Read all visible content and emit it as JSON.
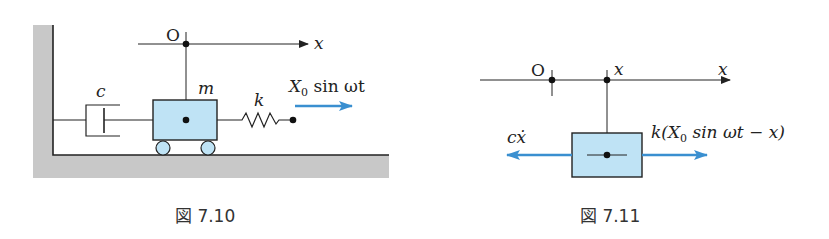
{
  "figures": [
    {
      "id": "fig-7-10",
      "caption": "図 7.10",
      "labels": {
        "origin": "O",
        "axis": "x",
        "damper": "c",
        "mass": "m",
        "spring": "k",
        "forcing": "X",
        "forcing_sub": "0",
        "forcing_rest": " sin ωt"
      }
    },
    {
      "id": "fig-7-11",
      "caption": "図 7.11",
      "labels": {
        "origin": "O",
        "position": "x",
        "axis": "x",
        "damping_force": "cẋ",
        "spring_force_pre": "k(X",
        "spring_force_sub": "0",
        "spring_force_post": " sin ωt − x)"
      }
    }
  ],
  "colors": {
    "mass_fill": "#bfe3f5",
    "force_arrow": "#3a8fd0",
    "ground": "#c8c8c8",
    "line": "#222222"
  }
}
